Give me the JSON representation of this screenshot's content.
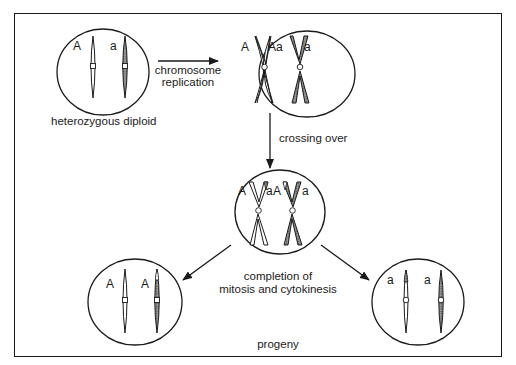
{
  "diagram": {
    "type": "genetics-process",
    "colors": {
      "stroke": "#1a1a1a",
      "chromosome_light": "#ffffff",
      "chromosome_shaded": "#8a8a8a",
      "background": "#ffffff"
    },
    "cells": [
      {
        "id": "cell-diploid",
        "caption": "heterozygous diploid",
        "alleles": [
          "A",
          "a"
        ],
        "stage": "G1 diploid"
      },
      {
        "id": "cell-replicated",
        "alleles": [
          "A",
          "Aa",
          "a"
        ],
        "stage": "after chromosome replication"
      },
      {
        "id": "cell-crossover",
        "alleles": [
          "A",
          "a",
          "A",
          "a"
        ],
        "stage": "after crossing over"
      },
      {
        "id": "cell-progeny-left",
        "alleles": [
          "A",
          "A"
        ],
        "stage": "progeny (homozygous A)"
      },
      {
        "id": "cell-progeny-right",
        "alleles": [
          "a",
          "a"
        ],
        "stage": "progeny (homozygous a)"
      }
    ],
    "arrows": [
      {
        "from": "cell-diploid",
        "to": "cell-replicated",
        "label_lines": [
          "chromosome",
          "replication"
        ]
      },
      {
        "from": "cell-replicated",
        "to": "cell-crossover",
        "label_lines": [
          "crossing over"
        ]
      },
      {
        "from": "cell-crossover",
        "to": "cell-progeny-left",
        "label_lines": []
      },
      {
        "from": "cell-crossover",
        "to": "cell-progeny-right",
        "label_lines": []
      }
    ],
    "labels": {
      "diploid_caption": "heterozygous diploid",
      "replication_line1": "chromosome",
      "replication_line2": "replication",
      "crossing_over": "crossing over",
      "completion_line1": "completion of",
      "completion_line2": "mitosis and cytokinesis",
      "progeny": "progeny"
    },
    "alleles": {
      "c1_left": "A",
      "c1_right": "a",
      "c2_left": "A",
      "c2_mid": "Aa",
      "c2_right": "a",
      "c3_a": "A",
      "c3_b": "a",
      "c3_c": "A",
      "c3_d": "a",
      "c4_left": "A",
      "c4_right": "A",
      "c5_left": "a",
      "c5_right": "a"
    }
  }
}
